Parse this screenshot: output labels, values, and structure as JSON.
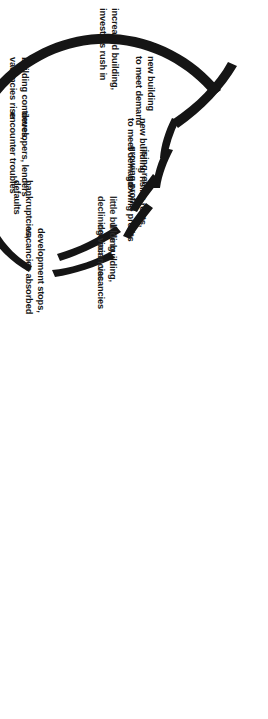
{
  "diagram": {
    "type": "cycle-wave-diagram",
    "orientation": "rotated-90-clockwise",
    "ink_color": "#151515",
    "background_color": "#ffffff",
    "stages": [
      {
        "id": "new-building-1",
        "line1": "new building",
        "line2": "to meet demand"
      },
      {
        "id": "rising-rents-1",
        "line1": "rising rents,",
        "line2": "growing profits"
      },
      {
        "id": "little-building-1",
        "line1": "little building,",
        "line2": "declining vacancies"
      },
      {
        "id": "development-stops",
        "line1": "development stops,",
        "line2": "vacancies absorbed"
      },
      {
        "id": "bankruptcies",
        "line1": "bankruptcies,",
        "line2": "defaults"
      },
      {
        "id": "developers-lenders",
        "line1": "developers, lenders",
        "line2": "encounter troubles"
      },
      {
        "id": "building-continues",
        "line1": "building continues,",
        "line2": "vacancies rise"
      },
      {
        "id": "increased-building",
        "line1": "increased building,",
        "line2": "investors rush in"
      },
      {
        "id": "new-building-2",
        "line1": "new building",
        "line2": "to meet demand"
      },
      {
        "id": "rising-rents-2",
        "line1": "rising rents,",
        "line2": "growing profits"
      },
      {
        "id": "little-building-2",
        "line1": "little bu lding,",
        "line2": "declining vacancies"
      }
    ]
  }
}
